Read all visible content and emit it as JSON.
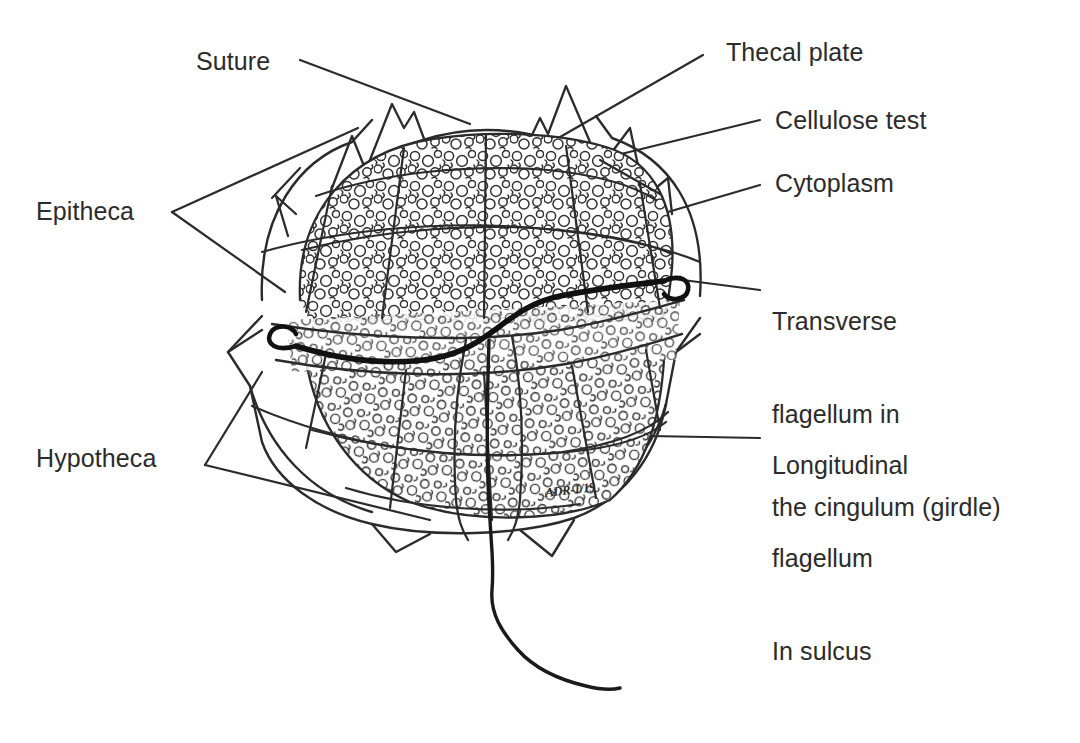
{
  "figure": {
    "kind": "labeled-biological-diagram",
    "background_color": "#ffffff",
    "ink_color": "#2b2b2b",
    "artist_signature": "ADR-1/19"
  },
  "labels": {
    "suture": "Suture",
    "epitheca": "Epitheca",
    "hypotheca": "Hypotheca",
    "thecal_plate": "Thecal plate",
    "cellulose_test": "Cellulose test",
    "cytoplasm": "Cytoplasm",
    "transverse_flagellum": {
      "line1": "Transverse",
      "line2": "flagellum in",
      "line3": "the cingulum (girdle)"
    },
    "longitudinal_flagellum": {
      "line1": "Longitudinal",
      "line2": "flagellum",
      "line3": "In sulcus"
    }
  },
  "structures": [
    {
      "name": "apical-horns",
      "description": "spiny projections at cell apex"
    },
    {
      "name": "epitheca",
      "description": "upper half of the theca above the cingulum"
    },
    {
      "name": "hypotheca",
      "description": "lower half of the theca below the cingulum"
    },
    {
      "name": "cingulum",
      "description": "transverse girdle groove encircling the cell"
    },
    {
      "name": "sulcus",
      "description": "longitudinal groove on the ventral hypotheca"
    },
    {
      "name": "thecal-plates",
      "description": "polygonal cellulose armour plates"
    },
    {
      "name": "sutures",
      "description": "seams between adjacent thecal plates"
    },
    {
      "name": "cytoplasm",
      "description": "granular interior contents"
    },
    {
      "name": "transverse-flagellum",
      "description": "thick ribbon flagellum lying in the cingulum"
    },
    {
      "name": "longitudinal-flagellum",
      "description": "trailing flagellum emerging from the sulcus"
    }
  ]
}
